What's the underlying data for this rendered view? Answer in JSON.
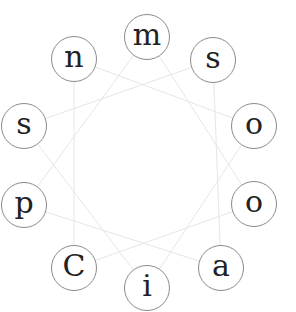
{
  "puzzle": {
    "type": "letter-wheel",
    "letters": [
      {
        "char": "m",
        "x": 147,
        "y": 37
      },
      {
        "char": "s",
        "x": 213,
        "y": 60
      },
      {
        "char": "o",
        "x": 254,
        "y": 126
      },
      {
        "char": "o",
        "x": 254,
        "y": 204
      },
      {
        "char": "a",
        "x": 221,
        "y": 268
      },
      {
        "char": "i",
        "x": 147,
        "y": 288
      },
      {
        "char": "C",
        "x": 74,
        "y": 268
      },
      {
        "char": "p",
        "x": 24,
        "y": 205
      },
      {
        "char": "s",
        "x": 24,
        "y": 126
      },
      {
        "char": "n",
        "x": 74,
        "y": 59
      }
    ],
    "line_color": "#e6e6e6",
    "circle_border": "#8a8a8a"
  }
}
